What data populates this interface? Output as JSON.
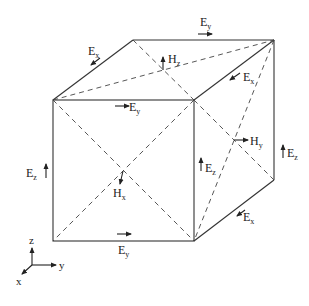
{
  "diagram": {
    "labels": {
      "ex_top_left": {
        "base": "E",
        "sub": "x"
      },
      "ey_top_back": {
        "base": "E",
        "sub": "y"
      },
      "hz_top": {
        "base": "H",
        "sub": "z"
      },
      "ex_top_right": {
        "base": "E",
        "sub": "x"
      },
      "ey_top_front": {
        "base": "E",
        "sub": "y"
      },
      "ez_back_right": {
        "base": "E",
        "sub": "z"
      },
      "hy_right": {
        "base": "H",
        "sub": "y"
      },
      "ez_left": {
        "base": "E",
        "sub": "z"
      },
      "ez_front_right": {
        "base": "E",
        "sub": "z"
      },
      "hx_front": {
        "base": "H",
        "sub": "x"
      },
      "ex_bottom_right": {
        "base": "E",
        "sub": "x"
      },
      "ey_bottom": {
        "base": "E",
        "sub": "y"
      }
    },
    "axes": {
      "z": "z",
      "y": "y",
      "x": "x"
    }
  }
}
